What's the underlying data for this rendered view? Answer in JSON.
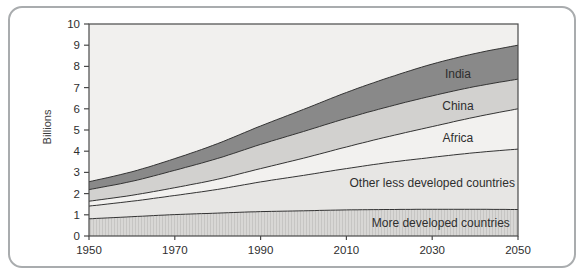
{
  "card": {
    "background": "#ffffff",
    "border_color": "#a9acae"
  },
  "chart_data": {
    "type": "area",
    "stacked": true,
    "title": "",
    "xlabel": "",
    "ylabel": "Billions",
    "xlim": [
      1950,
      2050
    ],
    "ylim": [
      0,
      10
    ],
    "grid": false,
    "legend_position": "in-plot band labels",
    "x": [
      1950,
      1960,
      1970,
      1980,
      1990,
      2000,
      2010,
      2020,
      2030,
      2040,
      2050
    ],
    "x_tick_labels": [
      "1950",
      "1970",
      "1990",
      "2010",
      "2030",
      "2050"
    ],
    "x_tick_years": [
      1950,
      1970,
      1990,
      2010,
      2030,
      2050
    ],
    "y_tick_labels": [
      "0",
      "1",
      "2",
      "3",
      "4",
      "5",
      "6",
      "7",
      "8",
      "9",
      "10"
    ],
    "y_tick_values": [
      0,
      1,
      2,
      3,
      4,
      5,
      6,
      7,
      8,
      9,
      10
    ],
    "plot_bg_color": "#f1f0ee",
    "axis_color": "#4a4a4a",
    "boundary_line_color": "#333333",
    "text_color": "#2e2e2e",
    "series": [
      {
        "name": "More developed countries",
        "fill": "#d8d7d5",
        "hatch": true,
        "hatch_line_color": "#c6c5c3",
        "label_at_year": 2032,
        "values": [
          0.81,
          0.91,
          1.01,
          1.08,
          1.15,
          1.19,
          1.23,
          1.25,
          1.26,
          1.26,
          1.25
        ]
      },
      {
        "name": "Other less developed countries",
        "fill": "#e7e6e4",
        "hatch": false,
        "label_at_year": 2030,
        "values": [
          0.6,
          0.73,
          0.9,
          1.12,
          1.4,
          1.67,
          1.95,
          2.22,
          2.45,
          2.67,
          2.85
        ]
      },
      {
        "name": "Africa",
        "fill": "#f2f1ef",
        "hatch": false,
        "label_at_year": 2036,
        "values": [
          0.23,
          0.28,
          0.37,
          0.48,
          0.63,
          0.81,
          1.02,
          1.23,
          1.45,
          1.68,
          1.9
        ]
      },
      {
        "name": "China",
        "fill": "#d2d1cf",
        "hatch": false,
        "label_at_year": 2036,
        "values": [
          0.55,
          0.66,
          0.82,
          0.98,
          1.14,
          1.26,
          1.35,
          1.41,
          1.45,
          1.44,
          1.4
        ]
      },
      {
        "name": "India",
        "fill": "#898989",
        "hatch": false,
        "label_at_year": 2036,
        "values": [
          0.37,
          0.45,
          0.55,
          0.7,
          0.87,
          1.04,
          1.22,
          1.37,
          1.5,
          1.56,
          1.6
        ]
      }
    ]
  }
}
